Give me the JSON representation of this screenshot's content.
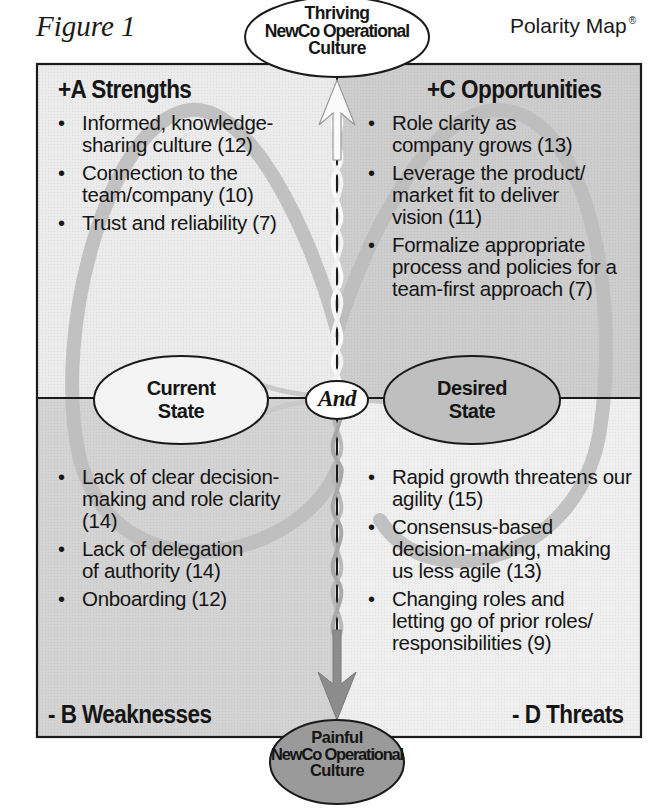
{
  "figure": {
    "label": "Figure 1",
    "brand": "Polarity Map",
    "brand_mark": "®"
  },
  "colors": {
    "quadrant_a_bg": "#ebebeb",
    "quadrant_c_bg": "#cdcdcd",
    "quadrant_b_bg": "#d3d3d3",
    "quadrant_d_bg": "#efefef",
    "loop_stroke": "#bdbdbd",
    "border": "#1a1a1a",
    "painful_fill": "#9a9a9a",
    "desired_fill": "#bfbfbf"
  },
  "top_goal": {
    "line1": "Thriving",
    "line2": "NewCo Operational",
    "line3": "Culture"
  },
  "bottom_fear": {
    "line1": "Painful",
    "line2": "NewCo Operational",
    "line3": "Culture"
  },
  "poles": {
    "left": {
      "line1": "Current",
      "line2": "State"
    },
    "connector": "And",
    "right": {
      "line1": "Desired",
      "line2": "State"
    }
  },
  "quadrants": {
    "a": {
      "title": "+A Strengths",
      "items": [
        {
          "text": "Informed, knowledge-sharing culture (12)"
        },
        {
          "text": "Connection to the team/company (10)"
        },
        {
          "text": "Trust and reliability (7)"
        }
      ]
    },
    "c": {
      "title": "+C Opportunities",
      "items": [
        {
          "text": "Role clarity as company grows (13)"
        },
        {
          "text": "Leverage the product/ market fit to deliver vision (11)"
        },
        {
          "text": "Formalize appropriate process and policies for a team-first approach (7)"
        }
      ]
    },
    "b": {
      "title": "- B Weaknesses",
      "items": [
        {
          "text": "Lack of clear decision-making and role clarity (14)"
        },
        {
          "text": "Lack of delegation of authority (14)"
        },
        {
          "text": "Onboarding (12)"
        }
      ]
    },
    "d": {
      "title": "- D Threats",
      "items": [
        {
          "text": "Rapid growth threatens our agility (15)"
        },
        {
          "text": "Consensus-based decision-making, making us less agile (13)"
        },
        {
          "text": "Changing roles and letting go of prior roles/ responsibilities (9)"
        }
      ]
    }
  }
}
